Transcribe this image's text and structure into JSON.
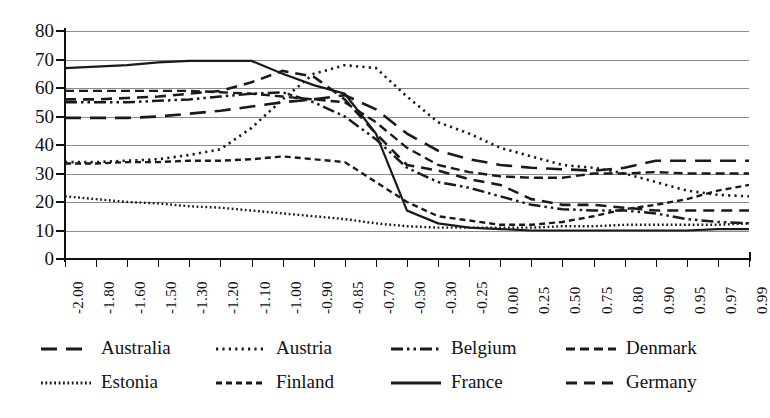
{
  "chart_data": {
    "type": "line",
    "title": "",
    "xlabel": "",
    "ylabel": "",
    "ylim": [
      0,
      80
    ],
    "ytick_step": 10,
    "grid": true,
    "legend_position": "bottom",
    "yticks": [
      "80",
      "70",
      "60",
      "50",
      "40",
      "30",
      "20",
      "10",
      "0"
    ],
    "categories": [
      "-2.00",
      "-1.80",
      "-1.60",
      "-1.50",
      "-1.30",
      "-1.20",
      "-1.10",
      "-1.00",
      "-0.90",
      "-0.85",
      "-0.70",
      "-0.50",
      "-0.30",
      "-0.25",
      "0.00",
      "0.25",
      "0.50",
      "0.75",
      "0.80",
      "0.90",
      "0.95",
      "0.97",
      "0.99"
    ],
    "series": [
      {
        "name": "Australia",
        "dash": "long-dash",
        "values": [
          49.5,
          49.5,
          49.5,
          50,
          51,
          52,
          53.5,
          55,
          56,
          57.5,
          52.5,
          44,
          38,
          35,
          33,
          32,
          31.5,
          31,
          32,
          34.5,
          34.5,
          34.5,
          34.5
        ]
      },
      {
        "name": "Austria",
        "dash": "dotted",
        "values": [
          34,
          34,
          34.5,
          35,
          36.5,
          38.5,
          46,
          56,
          65,
          68,
          67,
          57,
          48,
          44,
          39,
          36,
          33,
          32,
          30,
          27,
          24,
          22.5,
          22
        ]
      },
      {
        "name": "Belgium",
        "dash": "dash-dot-dot",
        "values": [
          55,
          55,
          55,
          55.5,
          56,
          57,
          58,
          58.5,
          55,
          50,
          42,
          32,
          27,
          25,
          22,
          19,
          17.5,
          17,
          17,
          16,
          14,
          13,
          12.5
        ]
      },
      {
        "name": "Denmark",
        "dash": "dashed",
        "values": [
          59,
          59,
          59,
          59,
          59,
          58.5,
          58,
          57,
          56,
          55,
          48,
          39,
          33,
          30.5,
          29,
          28.5,
          28.5,
          30,
          30,
          30.5,
          30,
          30,
          30
        ]
      },
      {
        "name": "Estonia",
        "dash": "fine-dots",
        "values": [
          22,
          21,
          20,
          19.5,
          18.5,
          18,
          17,
          16,
          15,
          14,
          12.5,
          11.5,
          11,
          11,
          11,
          11,
          11.5,
          11.5,
          12,
          12,
          12,
          12,
          12.5
        ]
      },
      {
        "name": "Finland",
        "dash": "small-dash",
        "values": [
          33.5,
          33.5,
          34,
          34,
          34.5,
          34.5,
          35,
          36,
          35,
          34,
          27,
          20,
          15,
          13.5,
          12,
          12,
          13,
          15,
          17.5,
          19,
          21,
          24,
          26
        ]
      },
      {
        "name": "France",
        "dash": "solid",
        "values": [
          67,
          67.5,
          68,
          69,
          69.5,
          69.5,
          69.5,
          65,
          61,
          58,
          44,
          17,
          12.5,
          11,
          10.5,
          10,
          10,
          10,
          10,
          10,
          10,
          10.5,
          10.5
        ]
      },
      {
        "name": "Germany",
        "dash": "medium-dash",
        "values": [
          56,
          56,
          56.5,
          57,
          58,
          59,
          62,
          66,
          64,
          56,
          44,
          33,
          31,
          28,
          26,
          21,
          19,
          19,
          18,
          17,
          17,
          17,
          17
        ]
      }
    ]
  },
  "legend": {
    "rows": [
      [
        {
          "label": "Australia",
          "swatch": "long-dash"
        },
        {
          "label": "Austria",
          "swatch": "dotted"
        },
        {
          "label": "Belgium",
          "swatch": "dash-dot-dot"
        },
        {
          "label": "Denmark",
          "swatch": "dashed"
        }
      ],
      [
        {
          "label": "Estonia",
          "swatch": "fine-dots"
        },
        {
          "label": "Finland",
          "swatch": "small-dash"
        },
        {
          "label": "France",
          "swatch": "solid"
        },
        {
          "label": "Germany",
          "swatch": "medium-dash"
        }
      ]
    ]
  }
}
